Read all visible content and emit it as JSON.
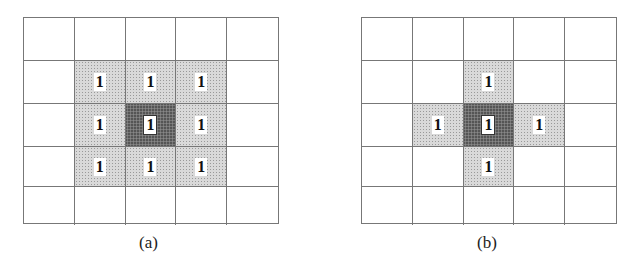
{
  "figures": [
    {
      "id": "a",
      "caption": "(a)",
      "description": "8-neighborhood (3x3 kernel)",
      "grid": [
        [
          "",
          "",
          "",
          "",
          ""
        ],
        [
          "",
          "1",
          "1",
          "1",
          ""
        ],
        [
          "",
          "1",
          "1",
          "1",
          ""
        ],
        [
          "",
          "1",
          "1",
          "1",
          ""
        ],
        [
          "",
          "",
          "",
          "",
          ""
        ]
      ],
      "shading": [
        [
          "none",
          "none",
          "none",
          "none",
          "none"
        ],
        [
          "none",
          "light",
          "light",
          "light",
          "none"
        ],
        [
          "none",
          "light",
          "dark",
          "light",
          "none"
        ],
        [
          "none",
          "light",
          "light",
          "light",
          "none"
        ],
        [
          "none",
          "none",
          "none",
          "none",
          "none"
        ]
      ]
    },
    {
      "id": "b",
      "caption": "(b)",
      "description": "4-neighborhood (cross kernel)",
      "grid": [
        [
          "",
          "",
          "",
          "",
          ""
        ],
        [
          "",
          "",
          "1",
          "",
          ""
        ],
        [
          "",
          "1",
          "1",
          "1",
          ""
        ],
        [
          "",
          "",
          "1",
          "",
          ""
        ],
        [
          "",
          "",
          "",
          "",
          ""
        ]
      ],
      "shading": [
        [
          "none",
          "none",
          "none",
          "none",
          "none"
        ],
        [
          "none",
          "none",
          "light",
          "none",
          "none"
        ],
        [
          "none",
          "light",
          "dark",
          "light",
          "none"
        ],
        [
          "none",
          "none",
          "light",
          "none",
          "none"
        ],
        [
          "none",
          "none",
          "none",
          "none",
          "none"
        ]
      ]
    }
  ],
  "colors": {
    "light_fill": "#d9d9d9",
    "dark_fill": "#555555",
    "grid_line": "#777777"
  }
}
